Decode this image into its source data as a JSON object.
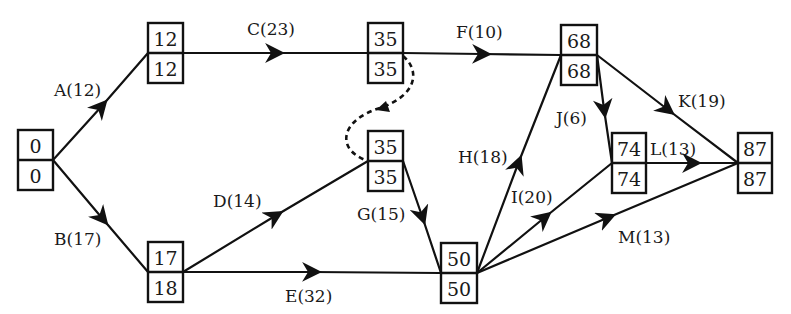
{
  "diagram": {
    "type": "activity-on-arrow network",
    "nodes": [
      {
        "id": "n1",
        "early": "0",
        "late": "0",
        "x": 18,
        "y": 130
      },
      {
        "id": "n2",
        "early": "12",
        "late": "12",
        "x": 148,
        "y": 23
      },
      {
        "id": "n3",
        "early": "17",
        "late": "18",
        "x": 148,
        "y": 242
      },
      {
        "id": "n4",
        "early": "35",
        "late": "35",
        "x": 368,
        "y": 23
      },
      {
        "id": "n5",
        "early": "35",
        "late": "35",
        "x": 368,
        "y": 131
      },
      {
        "id": "n6",
        "early": "50",
        "late": "50",
        "x": 441,
        "y": 243
      },
      {
        "id": "n7",
        "early": "68",
        "late": "68",
        "x": 561,
        "y": 25
      },
      {
        "id": "n8",
        "early": "74",
        "late": "74",
        "x": 612,
        "y": 133
      },
      {
        "id": "n9",
        "early": "87",
        "late": "87",
        "x": 738,
        "y": 133
      }
    ],
    "activities": [
      {
        "label": "A(12)",
        "from": "n1",
        "to": "n2"
      },
      {
        "label": "B(17)",
        "from": "n1",
        "to": "n3"
      },
      {
        "label": "C(23)",
        "from": "n2",
        "to": "n4"
      },
      {
        "label": "D(14)",
        "from": "n3",
        "to": "n5"
      },
      {
        "label": "E(32)",
        "from": "n3",
        "to": "n6"
      },
      {
        "label": "F(10)",
        "from": "n4",
        "to": "n7"
      },
      {
        "label": "G(15)",
        "from": "n5",
        "to": "n6"
      },
      {
        "label": "H(18)",
        "from": "n6",
        "to": "n7"
      },
      {
        "label": "I(20)",
        "from": "n6",
        "to": "n8"
      },
      {
        "label": "J(6)",
        "from": "n7",
        "to": "n8"
      },
      {
        "label": "K(19)",
        "from": "n7",
        "to": "n9"
      },
      {
        "label": "L(13)",
        "from": "n8",
        "to": "n9"
      },
      {
        "label": "M(13)",
        "from": "n6",
        "to": "n9"
      }
    ],
    "dummy_activities": [
      {
        "from": "n4",
        "to": "n5",
        "style": "dashed"
      }
    ],
    "colors": {
      "ink": "#111111",
      "background": "#ffffff"
    }
  }
}
